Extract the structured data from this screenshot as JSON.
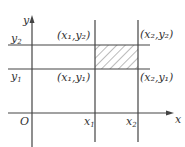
{
  "diagram": {
    "axes": {
      "x_label": "x",
      "y_label": "y",
      "origin_label": "O"
    },
    "lines": {
      "x1": {
        "label": "x",
        "sub": "1"
      },
      "x2": {
        "label": "x",
        "sub": "2"
      },
      "y1": {
        "label": "y",
        "sub": "1"
      },
      "y2": {
        "label": "y",
        "sub": "2"
      }
    },
    "points": [
      {
        "name": "x1y2",
        "text": "(x₁,y₂)"
      },
      {
        "name": "x2y2",
        "text": "(x₂,y₂)"
      },
      {
        "name": "x1y1",
        "text": "(x₁,y₁)"
      },
      {
        "name": "x2y1",
        "text": "(x₂,y₁)"
      }
    ],
    "shaded_region": "rectangle between x1, x2, y1, y2 (hatched)",
    "colors": {
      "line": "#444444",
      "text": "#333333",
      "background": "#ffffff"
    }
  }
}
